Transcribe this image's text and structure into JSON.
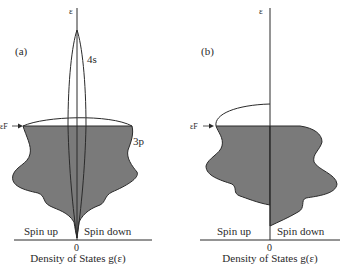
{
  "figure": {
    "panel_a": {
      "label": "(a)",
      "energy_axis_label": "ε",
      "fermi_label": "εF",
      "band_4s_label": "4s",
      "band_3p_label": "3p",
      "spin_up_label": "Spin up",
      "spin_down_label": "Spin down",
      "origin_label": "0",
      "x_axis_caption": "Density of States g(ε)"
    },
    "panel_b": {
      "label": "(b)",
      "energy_axis_label": "ε",
      "fermi_label": "εF",
      "spin_up_label": "Spin up",
      "spin_down_label": "Spin down",
      "origin_label": "0",
      "x_axis_caption": "Density of States g(ε)"
    },
    "colors": {
      "shade": "#7a7a7a",
      "line": "#2a2a2a",
      "background": "#ffffff"
    }
  }
}
